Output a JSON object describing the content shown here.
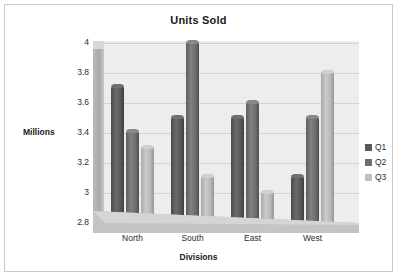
{
  "chart_data": {
    "type": "bar",
    "title": "Units Sold",
    "xlabel": "Divisions",
    "ylabel": "Millions",
    "categories": [
      "North",
      "South",
      "East",
      "West"
    ],
    "series": [
      {
        "name": "Q1",
        "values": [
          3.73,
          3.52,
          3.52,
          3.13
        ],
        "color": "#595959"
      },
      {
        "name": "Q2",
        "values": [
          3.43,
          4.02,
          3.62,
          3.52
        ],
        "color": "#6e6e6e"
      },
      {
        "name": "Q3",
        "values": [
          3.32,
          3.13,
          3.02,
          3.82
        ],
        "color": "#bfbfbf"
      }
    ],
    "ylim": [
      2.8,
      4.0
    ],
    "yticks": [
      "4",
      "3.8",
      "3.6",
      "3.4",
      "3.2",
      "3",
      "2.8"
    ],
    "ytick_values": [
      4,
      3.8,
      3.6,
      3.4,
      3.2,
      3,
      2.8
    ],
    "grid": true,
    "legend_position": "right",
    "style": "3d-cylinder"
  }
}
